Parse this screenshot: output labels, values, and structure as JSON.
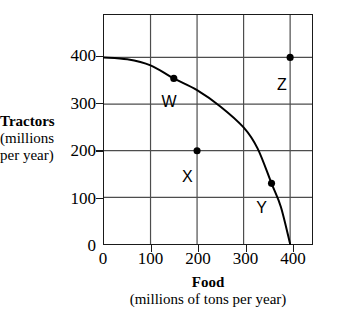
{
  "chart_data": {
    "type": "line",
    "title": "",
    "xlabel": "Food",
    "xlabel_sub": "(millions of tons per year)",
    "ylabel": "Tractors",
    "ylabel_sub_1": "(millions",
    "ylabel_sub_2": "per year)",
    "xlim": [
      0,
      447
    ],
    "ylim": [
      0,
      491
    ],
    "xticks": [
      0,
      100,
      200,
      300,
      400
    ],
    "yticks": [
      0,
      100,
      200,
      300,
      400
    ],
    "grid": true,
    "legend": "none",
    "series": [
      {
        "name": "production possibilities frontier",
        "type": "curve",
        "points": [
          {
            "x": 0,
            "y": 400
          },
          {
            "x": 50,
            "y": 396
          },
          {
            "x": 100,
            "y": 383
          },
          {
            "x": 150,
            "y": 355
          },
          {
            "x": 200,
            "y": 330
          },
          {
            "x": 250,
            "y": 295
          },
          {
            "x": 300,
            "y": 250
          },
          {
            "x": 330,
            "y": 205
          },
          {
            "x": 360,
            "y": 130
          },
          {
            "x": 380,
            "y": 80
          },
          {
            "x": 400,
            "y": 0
          }
        ]
      }
    ],
    "annotated_points": [
      {
        "label": "W",
        "x": 150,
        "y": 355,
        "on_curve": true,
        "label_dx": -12,
        "label_dy": 16
      },
      {
        "label": "X",
        "x": 200,
        "y": 200,
        "on_curve": false,
        "label_dx": -15,
        "label_dy": 18
      },
      {
        "label": "Y",
        "x": 360,
        "y": 130,
        "on_curve": true,
        "label_dx": -16,
        "label_dy": 16
      },
      {
        "label": "Z",
        "x": 400,
        "y": 400,
        "on_curve": false,
        "label_dx": -14,
        "label_dy": 20
      }
    ]
  },
  "axes": {
    "x_tick_labels": [
      "0",
      "100",
      "200",
      "300",
      "400"
    ],
    "y_tick_labels": [
      "0",
      "100",
      "200",
      "300",
      "400"
    ]
  },
  "colors": {
    "axis": "#1a1a1a",
    "grid": "#4d4d4d",
    "curve": "#000000",
    "point": "#000000",
    "background": "#ffffff"
  }
}
